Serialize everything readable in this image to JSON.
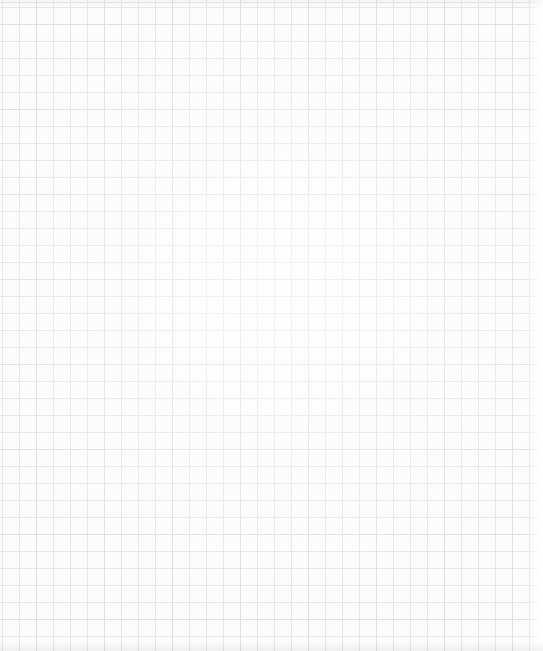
{
  "page": {
    "width_px": 543,
    "height_px": 651
  },
  "grid": {
    "cell_size_px": 17,
    "columns": 32,
    "rows": 38,
    "paper_color": "#fcfcfc",
    "line_color": "#e6e6e9",
    "line_color_strong": "#d9d9dd",
    "right_edge_fade_color": "#ffffff"
  }
}
